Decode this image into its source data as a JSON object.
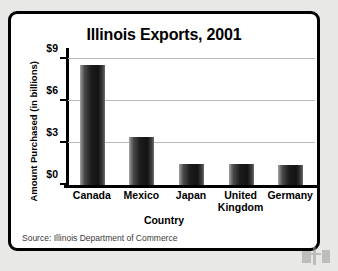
{
  "chart_data": {
    "type": "bar",
    "title": "Illinois Exports, 2001",
    "xlabel": "Country",
    "ylabel": "Amount Purchased (in billions)",
    "categories": [
      "Canada",
      "Mexico",
      "Japan",
      "United Kingdom",
      "Germany"
    ],
    "values": [
      8.6,
      3.4,
      1.5,
      1.5,
      1.45
    ],
    "ylim": [
      0,
      9
    ],
    "yticks": [
      0,
      3,
      6,
      9
    ],
    "ytick_labels": [
      "$0",
      "$3",
      "$6",
      "$9"
    ],
    "grid": true,
    "legend": "none",
    "series": [
      {
        "name": "Amount Purchased",
        "values": [
          8.6,
          3.4,
          1.5,
          1.5,
          1.45
        ]
      }
    ]
  },
  "source": {
    "note": "Source: Illinois Department of Commerce"
  },
  "colors": {
    "bar_dark": "#131313",
    "bar_light": "#8d8d8d",
    "frame": "#000000",
    "gridline": "#b9b9b9",
    "page_background": "#e8e8e6",
    "plot_background": "#ffffff"
  }
}
